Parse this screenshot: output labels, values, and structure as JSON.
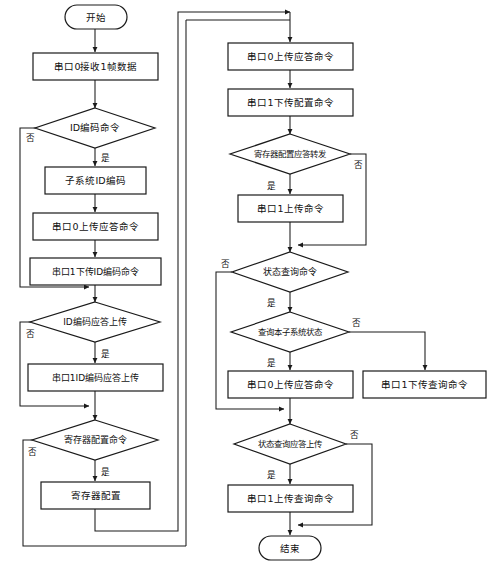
{
  "diagram": {
    "type": "flowchart",
    "language": "zh-CN",
    "colors": {
      "background": "#ffffff",
      "stroke": "#1a1a1a",
      "text": "#111111"
    },
    "labels": {
      "yes": "是",
      "no": "否"
    }
  },
  "nodes": {
    "start": {
      "label": "开始",
      "shape": "terminal"
    },
    "recv_frame": {
      "label": "串口0接收1帧数据",
      "shape": "process"
    },
    "id_encode_cmd": {
      "label": "ID编码命令",
      "shape": "decision"
    },
    "subsystem_id_encode": {
      "label": "子系统ID编码",
      "shape": "process"
    },
    "uart0_upload_ack": {
      "label": "串口0上传应答命令",
      "shape": "process"
    },
    "uart1_down_id_encode": {
      "label": "串口1下传ID编码命令",
      "shape": "process"
    },
    "id_encode_ack_upload": {
      "label": "ID编码应答上传",
      "shape": "decision"
    },
    "uart1_id_encode_ack_upload": {
      "label": "串口1ID编码应答上传",
      "shape": "process"
    },
    "reg_config_cmd": {
      "label": "寄存器配置命令",
      "shape": "decision"
    },
    "reg_config": {
      "label": "寄存器配置",
      "shape": "process"
    },
    "uart0_upload_ack2": {
      "label": "串口0上传应答命令",
      "shape": "process"
    },
    "uart1_down_config": {
      "label": "串口1下传配置命令",
      "shape": "process"
    },
    "reg_config_ack_forward": {
      "label": "寄存器配置应答转发",
      "shape": "decision"
    },
    "uart1_upload_cmd": {
      "label": "串口1上传命令",
      "shape": "process"
    },
    "status_query_cmd": {
      "label": "状态查询命令",
      "shape": "decision"
    },
    "query_local_status": {
      "label": "查询本子系统状态",
      "shape": "decision"
    },
    "uart0_upload_ack3": {
      "label": "串口0上传应答命令",
      "shape": "process"
    },
    "uart1_down_query": {
      "label": "串口1下传查询命令",
      "shape": "process"
    },
    "status_query_ack_upload": {
      "label": "状态查询应答上传",
      "shape": "decision"
    },
    "uart1_upload_query": {
      "label": "串口1上传查询命令",
      "shape": "process"
    },
    "end": {
      "label": "结束",
      "shape": "terminal"
    }
  },
  "edge_labels": {
    "id_encode_cmd_no": "否",
    "id_encode_cmd_yes": "是",
    "id_encode_ack_no": "否",
    "id_encode_ack_yes": "是",
    "reg_config_cmd_no": "否",
    "reg_config_cmd_yes": "是",
    "reg_ack_forward_no": "否",
    "reg_ack_forward_yes": "是",
    "status_query_no": "否",
    "status_query_yes": "是",
    "query_local_no": "否",
    "query_local_yes": "是",
    "status_ack_no": "否",
    "status_ack_yes": "是"
  }
}
